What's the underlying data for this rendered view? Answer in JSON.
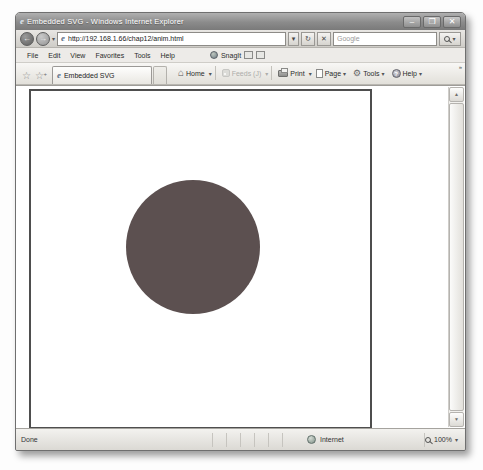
{
  "window": {
    "title": "Embedded SVG - Windows Internet Explorer"
  },
  "address_bar": {
    "url": "http://192.168.1.66/chap12/anim.html",
    "search_placeholder": "Google"
  },
  "menu_bar": {
    "items": [
      "File",
      "Edit",
      "View",
      "Favorites",
      "Tools",
      "Help"
    ],
    "snagit_label": "SnagIt"
  },
  "command_bar": {
    "tab_label": "Embedded SVG",
    "home_label": "Home",
    "feeds_label": "Feeds (J)",
    "print_label": "Print",
    "page_label": "Page",
    "tools_label": "Tools",
    "help_label": "Help"
  },
  "content": {
    "circle_color": "#5c5050"
  },
  "status_bar": {
    "status": "Done",
    "zone": "Internet",
    "zoom_level": "100%"
  },
  "icons": {
    "ie_logo": "e",
    "minimize": "–",
    "maximize": "❒",
    "close": "✕",
    "back": "←",
    "forward": "→",
    "caret": "▾",
    "refresh": "↻",
    "stop": "✕",
    "favorites_star": "☆",
    "add_star": "☆",
    "plus": "+",
    "home": "⌂",
    "gear": "⚙",
    "help_q": "?",
    "scroll_up": "▲",
    "scroll_down": "▼",
    "overflow": "»"
  }
}
